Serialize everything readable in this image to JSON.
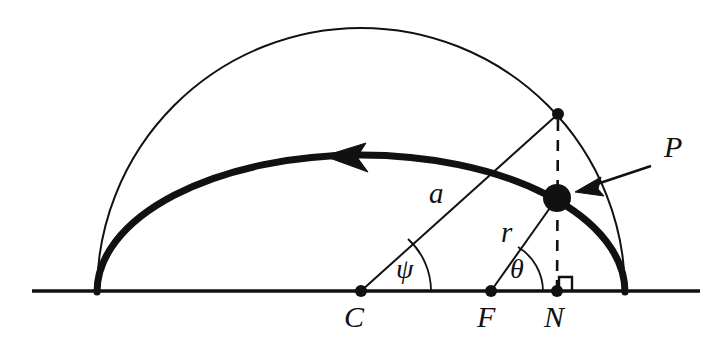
{
  "figure": {
    "type": "geometric-diagram",
    "background_color": "#ffffff",
    "stroke_color": "#111111"
  },
  "labels": {
    "center": "C",
    "focus": "F",
    "foot_of_perpendicular": "N",
    "point_on_orbit": "P",
    "semi_major_axis": "a",
    "radius_vector": "r",
    "eccentric_anomaly": "ψ",
    "true_anomaly": "θ"
  },
  "geometry": {
    "baseline": {
      "x1": 32,
      "y1": 291,
      "x2": 700,
      "y2": 291
    },
    "points": {
      "C": {
        "x": 361,
        "y": 291
      },
      "F": {
        "x": 491,
        "y": 291
      },
      "N": {
        "x": 557,
        "y": 291
      },
      "P": {
        "x": 557,
        "y": 198
      },
      "Q": {
        "x": 558,
        "y": 114
      },
      "left_apse": {
        "x": 97,
        "y": 292
      },
      "right_apse": {
        "x": 625,
        "y": 292
      }
    },
    "circle": {
      "cx": 361,
      "cy": 292,
      "r": 264,
      "stroke_width": 2
    },
    "ellipse": {
      "cx": 361,
      "cy": 292,
      "rx": 264,
      "ry": 137,
      "stroke_width": 7
    },
    "angle_arcs": {
      "psi_radius": 70,
      "theta_radius": 52
    },
    "right_angle_marker": {
      "x": 559,
      "y": 277,
      "size": 13
    },
    "arrow_to_P": {
      "x1": 651,
      "y1": 166,
      "x2": 578,
      "y2": 190
    },
    "direction_arrowhead": {
      "x": 347,
      "y": 157,
      "points_toward": "left"
    }
  },
  "label_positions": {
    "C": {
      "left": 344,
      "top": 304
    },
    "F": {
      "left": 476,
      "top": 304
    },
    "N": {
      "left": 543,
      "top": 304
    },
    "P": {
      "left": 663,
      "top": 133
    },
    "a": {
      "left": 428,
      "top": 180
    },
    "r": {
      "left": 500,
      "top": 219
    },
    "psi": {
      "left": 396,
      "top": 256
    },
    "theta": {
      "left": 509,
      "top": 256
    }
  }
}
